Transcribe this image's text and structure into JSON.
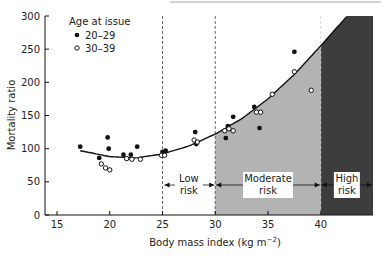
{
  "chart_data": {
    "type": "scatter",
    "title": "",
    "xlabel": "Body mass index (kg m−2)",
    "ylabel": "Mortality ratio",
    "xlim": [
      13,
      45
    ],
    "ylim": [
      0,
      300
    ],
    "x_ticks": [
      15,
      20,
      25,
      30,
      35,
      40
    ],
    "y_ticks": [
      0,
      50,
      100,
      150,
      200,
      250,
      300
    ],
    "grid": false,
    "legend": {
      "title": "Age at issue",
      "position": "top-left",
      "entries": [
        {
          "label": "20–29",
          "marker": "filled-circle"
        },
        {
          "label": "30–39",
          "marker": "open-circle"
        }
      ]
    },
    "series": [
      {
        "name": "20–29",
        "marker": "filled",
        "points": [
          [
            17.2,
            103
          ],
          [
            19.0,
            86
          ],
          [
            19.8,
            117
          ],
          [
            19.9,
            100
          ],
          [
            21.3,
            91
          ],
          [
            22.0,
            91
          ],
          [
            22.6,
            103
          ],
          [
            25.0,
            95
          ],
          [
            25.3,
            97
          ],
          [
            28.1,
            125
          ],
          [
            28.2,
            107
          ],
          [
            31.0,
            116
          ],
          [
            31.2,
            134
          ],
          [
            31.7,
            148
          ],
          [
            33.7,
            163
          ],
          [
            34.2,
            131
          ],
          [
            37.5,
            246
          ]
        ]
      },
      {
        "name": "30–39",
        "marker": "open",
        "points": [
          [
            19.2,
            77
          ],
          [
            19.6,
            71
          ],
          [
            20.0,
            68
          ],
          [
            21.6,
            85
          ],
          [
            22.1,
            84
          ],
          [
            22.9,
            84
          ],
          [
            24.9,
            90
          ],
          [
            25.2,
            90
          ],
          [
            28.0,
            113
          ],
          [
            28.3,
            110
          ],
          [
            30.9,
            127
          ],
          [
            31.3,
            130
          ],
          [
            31.7,
            127
          ],
          [
            33.9,
            155
          ],
          [
            34.3,
            155
          ],
          [
            35.4,
            182
          ],
          [
            37.5,
            216
          ],
          [
            39.1,
            188
          ]
        ]
      }
    ],
    "trend_curve": {
      "name": "fitted curve",
      "points": [
        [
          17.2,
          97
        ],
        [
          20,
          88
        ],
        [
          22.5,
          86
        ],
        [
          25,
          92
        ],
        [
          27.5,
          104
        ],
        [
          30,
          122
        ],
        [
          32.5,
          145
        ],
        [
          35,
          175
        ],
        [
          37.5,
          212
        ],
        [
          40,
          255
        ],
        [
          42.5,
          300
        ]
      ]
    },
    "regions": [
      {
        "label": "Low risk",
        "x_range": [
          25,
          30
        ],
        "fill": "#ffffff"
      },
      {
        "label": "Moderate risk",
        "x_range": [
          30,
          40
        ],
        "fill": "#b3b3b3"
      },
      {
        "label": "High risk",
        "x_range": [
          40,
          45
        ],
        "fill": "#3d3d3d"
      }
    ],
    "reference_lines": [
      25,
      30,
      40
    ]
  },
  "legend_title": "Age at issue",
  "legend_items": [
    "20–29",
    "30–39"
  ],
  "axis": {
    "xlabel_main": "Body mass index (kg m",
    "xlabel_sup": "−2",
    "xlabel_end": ")",
    "ylabel": "Mortality ratio",
    "xticks": [
      "15",
      "20",
      "25",
      "30",
      "35",
      "40"
    ],
    "yticks": [
      "0",
      "50",
      "100",
      "150",
      "200",
      "250",
      "300"
    ]
  },
  "regions": {
    "low": [
      "Low",
      "risk"
    ],
    "moderate": [
      "Moderate",
      "risk"
    ],
    "high": [
      "High",
      "risk"
    ]
  },
  "colors": {
    "moderate_fill": "#b3b3b3",
    "high_fill": "#3d3d3d",
    "ink": "#1a1a1a"
  }
}
